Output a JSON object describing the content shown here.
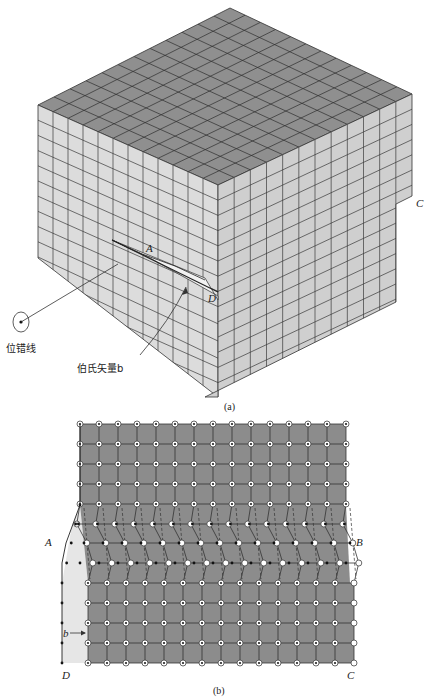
{
  "figure": {
    "panel_a": {
      "caption": "(a)",
      "labels": {
        "A": "A",
        "C": "C",
        "D": "D",
        "dislocation_line": "位错线",
        "burgers_vector": "伯氏矢量b"
      }
    },
    "panel_b": {
      "caption": "(b)",
      "labels": {
        "A": "A",
        "B": "B",
        "C": "C",
        "D": "D",
        "b": "b"
      },
      "lattice": {
        "columns": 15,
        "upper_rows": 5,
        "distorted_rows": 3,
        "lower_rows": 5
      }
    },
    "colors": {
      "top_face": "#8f8f8f",
      "side_face": "#d9d9d9",
      "grid_line": "#333333",
      "lattice_fill": "#8c8c8c",
      "slip_region": "#e6e6e6"
    }
  }
}
